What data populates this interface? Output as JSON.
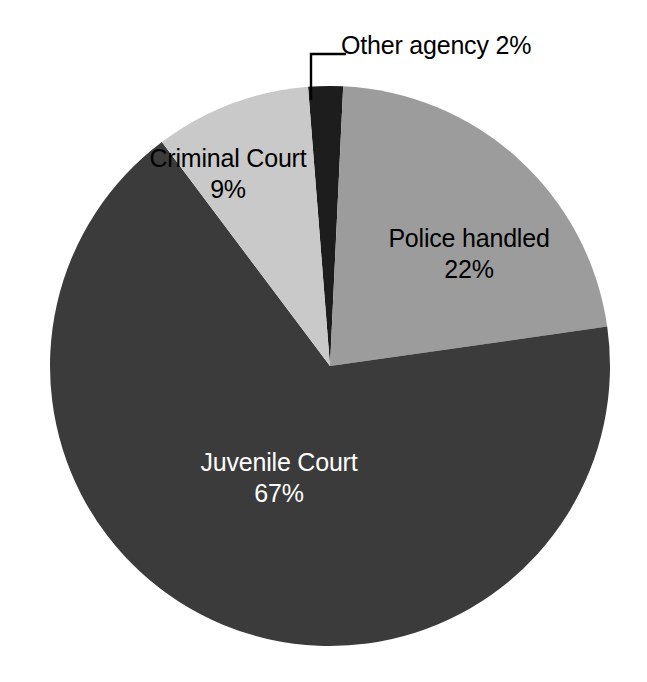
{
  "chart_data": {
    "type": "pie",
    "title": "",
    "subtitle": "",
    "xlabel": "",
    "ylabel": "",
    "grid": false,
    "legend": "none",
    "units": "percent",
    "total": 100,
    "start_angle_deg": -94.5,
    "direction": "clockwise",
    "categories": [
      "Other agency",
      "Police handled",
      "Juvenile Court",
      "Criminal Court"
    ],
    "values": [
      2,
      22,
      67,
      9
    ],
    "labels": [
      "Other agency 2%",
      "Police handled 22%",
      "Juvenile Court 67%",
      "Criminal Court 9%"
    ],
    "slices": [
      {
        "name": "Other agency",
        "value": 2,
        "value_label": "2%",
        "combined_label": "Other agency 2%",
        "color": "#1d1d1d",
        "text_color": "#000000",
        "label_placement": "outside-callout",
        "sweep_deg": 7.2
      },
      {
        "name": "Police handled",
        "value": 22,
        "value_label": "22%",
        "combined_label": "Police handled 22%",
        "color": "#9c9c9c",
        "text_color": "#000000",
        "label_placement": "inside",
        "sweep_deg": 79.2
      },
      {
        "name": "Juvenile Court",
        "value": 67,
        "value_label": "67%",
        "combined_label": "Juvenile Court 67%",
        "color": "#3b3b3b",
        "text_color": "#ffffff",
        "label_placement": "inside",
        "sweep_deg": 241.2
      },
      {
        "name": "Criminal Court",
        "value": 9,
        "value_label": "9%",
        "combined_label": "Criminal Court 9%",
        "color": "#c9c9c9",
        "text_color": "#000000",
        "label_placement": "inside",
        "sweep_deg": 32.4
      }
    ]
  },
  "figure": {
    "background": "#ffffff",
    "center_x": 330,
    "center_y": 366,
    "radius": 280
  }
}
